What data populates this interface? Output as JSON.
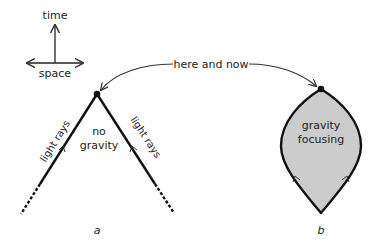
{
  "axes": {
    "time_label": "time",
    "space_label": "space"
  },
  "connector": {
    "label": "here and now"
  },
  "panel_a": {
    "label_line1": "no",
    "label_line2": "gravity",
    "left_ray_label": "light rays",
    "right_ray_label": "light rays",
    "caption": "a"
  },
  "panel_b": {
    "label_line1": "gravity",
    "label_line2": "focusing",
    "caption": "b",
    "fill_color": "#cccccc"
  },
  "colors": {
    "stroke": "#111111",
    "arrow": "#333333",
    "text": "#222222"
  }
}
